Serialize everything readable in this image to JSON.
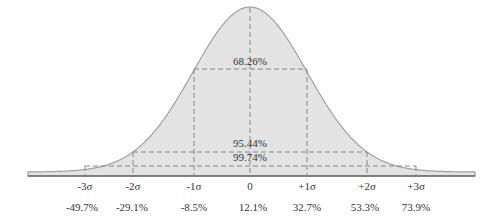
{
  "chart_data": {
    "type": "area",
    "title": "",
    "x_ticks": [
      "-3σ",
      "-2σ",
      "-1σ",
      "0",
      "+1σ",
      "+2σ",
      "+3σ"
    ],
    "tick_values": [
      "-49.7%",
      "-29.1%",
      "-8.5%",
      "12.1%",
      "32.7%",
      "53.3%",
      "73.9%"
    ],
    "bands": [
      {
        "label": "68.26%",
        "range": [
          "-1σ",
          "+1σ"
        ]
      },
      {
        "label": "95.44%",
        "range": [
          "-2σ",
          "+2σ"
        ]
      },
      {
        "label": "99.74%",
        "range": [
          "-3σ",
          "+3σ"
        ]
      }
    ],
    "fill_color": "#e0e0e0",
    "line_color": "#9a9a9a"
  },
  "ticks": [
    {
      "sigma": "-3σ",
      "value": "-49.7%"
    },
    {
      "sigma": "-2σ",
      "value": "-29.1%"
    },
    {
      "sigma": "-1σ",
      "value": "-8.5%"
    },
    {
      "sigma": "0",
      "value": "12.1%"
    },
    {
      "sigma": "+1σ",
      "value": "32.7%"
    },
    {
      "sigma": "+2σ",
      "value": "53.3%"
    },
    {
      "sigma": "+3σ",
      "value": "73.9%"
    }
  ],
  "bands": {
    "one": "68.26%",
    "two": "95.44%",
    "three": "99.74%"
  }
}
